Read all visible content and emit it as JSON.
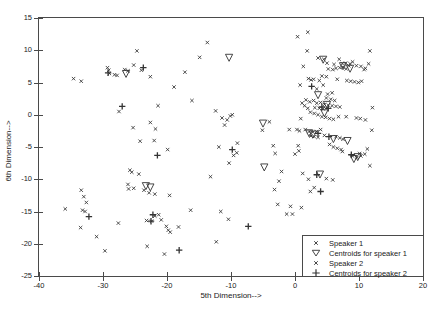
{
  "chart_data": {
    "type": "scatter",
    "title": "",
    "xlabel": "5th Dimension-->",
    "ylabel": "6th Dimension-->",
    "xlim": [
      -40,
      20
    ],
    "ylim": [
      -25,
      15
    ],
    "xticks": [
      -40,
      -30,
      -20,
      -10,
      0,
      10,
      20
    ],
    "yticks": [
      -25,
      -20,
      -15,
      -10,
      -5,
      0,
      5,
      10,
      15
    ],
    "xticklabels": [
      "-40",
      "-30",
      "-20",
      "-10",
      "0",
      "10",
      "20"
    ],
    "yticklabels": [
      "-25",
      "-20",
      "-15",
      "-10",
      "-5",
      "0",
      "5",
      "10",
      "15"
    ],
    "grid": false,
    "legend_position": "lower right",
    "marker_color": "#333333",
    "axis_color": "#4a4a4a",
    "series": [
      {
        "name": "Speaker 1",
        "marker": "x-small",
        "points": [
          [
            -34.6,
            5.6
          ],
          [
            -33.4,
            5.2
          ],
          [
            -29.3,
            7.3
          ],
          [
            -29.1,
            6.9
          ],
          [
            -29.0,
            6.4
          ],
          [
            -28.2,
            6.2
          ],
          [
            -27.8,
            6.1
          ],
          [
            -26.6,
            7.0
          ],
          [
            -26.1,
            6.8
          ],
          [
            -25.2,
            7.7
          ],
          [
            -24.7,
            9.9
          ],
          [
            -24.0,
            6.9
          ],
          [
            -22.6,
            5.9
          ],
          [
            -27.5,
            0.5
          ],
          [
            -25.3,
            -2.0
          ],
          [
            -24.2,
            -4.1
          ],
          [
            -22.6,
            -1.2
          ],
          [
            -21.4,
            1.4
          ],
          [
            -21.8,
            -2.2
          ],
          [
            -22.0,
            -4.0
          ],
          [
            -19.9,
            -5.4
          ],
          [
            -18.9,
            4.3
          ],
          [
            -17.2,
            6.6
          ],
          [
            -16.1,
            2.2
          ],
          [
            -13.7,
            11.2
          ],
          [
            -14.9,
            8.9
          ],
          [
            -12.4,
            0.6
          ],
          [
            -11.4,
            -0.5
          ],
          [
            -11.0,
            -1.6
          ],
          [
            -10.1,
            -0.2
          ],
          [
            -9.8,
            0.0
          ],
          [
            -10.6,
            -0.8
          ],
          [
            -11.9,
            -5.0
          ],
          [
            -10.3,
            -7.5
          ],
          [
            -9.0,
            -4.4
          ],
          [
            -9.6,
            -6.3
          ],
          [
            -9.1,
            -5.9
          ],
          [
            -13.2,
            -9.6
          ],
          [
            -16.3,
            -14.8
          ],
          [
            -11.6,
            -15.0
          ],
          [
            -10.4,
            -16.2
          ],
          [
            -12.3,
            -19.7
          ],
          [
            -25.8,
            -8.6
          ],
          [
            -25.5,
            -8.9
          ],
          [
            -26.1,
            -10.8
          ],
          [
            -26.0,
            -11.5
          ],
          [
            -24.4,
            -9.2
          ],
          [
            -25.2,
            -11.4
          ],
          [
            -23.6,
            -11.7
          ],
          [
            -22.8,
            -12.1
          ],
          [
            -21.9,
            -12.3
          ],
          [
            -19.6,
            -12.5
          ],
          [
            -33.4,
            -11.7
          ],
          [
            -33.0,
            -12.7
          ],
          [
            -32.6,
            -13.6
          ],
          [
            -35.9,
            -14.6
          ],
          [
            -33.2,
            -14.8
          ],
          [
            -32.8,
            -15.0
          ],
          [
            -33.5,
            -17.5
          ],
          [
            -31.0,
            -18.9
          ],
          [
            -29.7,
            -21.1
          ],
          [
            -27.6,
            -16.8
          ],
          [
            -21.9,
            -15.7
          ],
          [
            -21.3,
            -15.5
          ],
          [
            -20.9,
            -16.3
          ],
          [
            -20.1,
            -17.3
          ],
          [
            -19.8,
            -17.9
          ],
          [
            -19.5,
            -18.2
          ],
          [
            -18.2,
            -17.4
          ],
          [
            -22.4,
            -16.5
          ],
          [
            -23.1,
            -20.4
          ],
          [
            -20.4,
            -21.6
          ],
          [
            -23.2,
            -16.4
          ],
          [
            -5.1,
            -2.4
          ],
          [
            -4.0,
            -1.1
          ],
          [
            -3.4,
            -4.8
          ],
          [
            -3.1,
            -6.0
          ],
          [
            -2.1,
            -8.8
          ],
          [
            -2.5,
            -10.3
          ],
          [
            -3.2,
            -11.6
          ],
          [
            -2.7,
            -13.9
          ],
          [
            -1.3,
            -15.4
          ],
          [
            -0.7,
            -14.2
          ],
          [
            0.6,
            -5.6
          ],
          [
            1.2,
            -9.1
          ],
          [
            2.1,
            -10.0
          ],
          [
            3.0,
            -11.3
          ],
          [
            2.4,
            -11.9
          ]
        ]
      },
      {
        "name": "Speaker 2",
        "marker": "x-small",
        "points": [
          [
            0.4,
            12.1
          ],
          [
            2.0,
            12.8
          ],
          [
            1.9,
            9.9
          ],
          [
            3.6,
            8.8
          ],
          [
            4.5,
            8.6
          ],
          [
            5.0,
            8.0
          ],
          [
            6.1,
            7.8
          ],
          [
            7.4,
            7.9
          ],
          [
            7.9,
            8.0
          ],
          [
            8.6,
            7.9
          ],
          [
            9.6,
            7.6
          ],
          [
            10.3,
            7.5
          ],
          [
            11.0,
            7.2
          ],
          [
            11.5,
            7.9
          ],
          [
            11.7,
            9.9
          ],
          [
            5.2,
            7.1
          ],
          [
            5.9,
            7.0
          ],
          [
            6.4,
            7.2
          ],
          [
            7.0,
            7.3
          ],
          [
            7.5,
            7.4
          ],
          [
            8.0,
            7.1
          ],
          [
            8.4,
            7.6
          ],
          [
            4.2,
            6.0
          ],
          [
            4.9,
            5.9
          ],
          [
            6.6,
            5.5
          ],
          [
            8.1,
            5.3
          ],
          [
            8.7,
            5.2
          ],
          [
            9.3,
            5.1
          ],
          [
            9.9,
            5.0
          ],
          [
            10.4,
            5.2
          ],
          [
            1.3,
            7.5
          ],
          [
            2.1,
            5.6
          ],
          [
            2.5,
            5.4
          ],
          [
            2.9,
            5.5
          ],
          [
            0.8,
            4.6
          ],
          [
            3.4,
            4.0
          ],
          [
            5.1,
            3.2
          ],
          [
            5.8,
            3.4
          ],
          [
            1.7,
            2.3
          ],
          [
            2.3,
            2.0
          ],
          [
            2.9,
            2.2
          ],
          [
            3.4,
            1.8
          ],
          [
            4.0,
            1.9
          ],
          [
            4.6,
            1.6
          ],
          [
            5.2,
            1.5
          ],
          [
            5.8,
            1.4
          ],
          [
            6.4,
            1.3
          ],
          [
            7.0,
            1.2
          ],
          [
            3.1,
            1.1
          ],
          [
            3.8,
            1.0
          ],
          [
            4.4,
            0.9
          ],
          [
            2.0,
            1.0
          ],
          [
            2.4,
            0.4
          ],
          [
            3.0,
            0.2
          ],
          [
            3.6,
            0.0
          ],
          [
            4.2,
            -0.3
          ],
          [
            4.8,
            -0.4
          ],
          [
            5.4,
            -0.6
          ],
          [
            6.0,
            -0.7
          ],
          [
            6.8,
            -0.3
          ],
          [
            8.0,
            -0.3
          ],
          [
            9.6,
            -0.5
          ],
          [
            10.2,
            -0.6
          ],
          [
            12.1,
            1.1
          ],
          [
            0.9,
            -0.6
          ],
          [
            0.3,
            -2.3
          ],
          [
            0.7,
            -2.5
          ],
          [
            1.6,
            -2.3
          ],
          [
            2.2,
            -2.6
          ],
          [
            2.8,
            -2.7
          ],
          [
            3.4,
            -2.6
          ],
          [
            4.0,
            -2.3
          ],
          [
            2.5,
            -3.3
          ],
          [
            3.0,
            -3.4
          ],
          [
            3.6,
            -3.5
          ],
          [
            4.6,
            -3.2
          ],
          [
            5.4,
            -4.6
          ],
          [
            6.0,
            -5.0
          ],
          [
            6.6,
            -5.2
          ],
          [
            7.2,
            -5.4
          ],
          [
            9.0,
            -6.4
          ],
          [
            9.7,
            -6.6
          ],
          [
            10.3,
            -6.4
          ],
          [
            10.9,
            -6.1
          ],
          [
            11.3,
            -5.3
          ],
          [
            11.7,
            -7.9
          ],
          [
            12.0,
            -2.4
          ],
          [
            11.0,
            -0.8
          ],
          [
            0.5,
            -4.8
          ],
          [
            0.0,
            -6.1
          ],
          [
            1.0,
            -14.4
          ],
          [
            -0.4,
            -15.4
          ],
          [
            4.9,
            -9.9
          ],
          [
            5.9,
            -10.1
          ],
          [
            7.4,
            -5.7
          ],
          [
            10.1,
            -6.0
          ],
          [
            6.4,
            -3.4
          ],
          [
            7.0,
            -3.6
          ],
          [
            7.5,
            -3.8
          ],
          [
            4.9,
            2.6
          ],
          [
            5.6,
            2.4
          ],
          [
            6.2,
            2.2
          ],
          [
            4.4,
            4.6
          ],
          [
            3.8,
            5.3
          ],
          [
            1.1,
            1.8
          ],
          [
            1.5,
            1.4
          ],
          [
            -0.9,
            -2.3
          ],
          [
            10.8,
            7.0
          ],
          [
            9.0,
            8.2
          ],
          [
            6.9,
            8.6
          ]
        ]
      },
      {
        "name": "Centroids for speaker 1",
        "marker": "triangle-down",
        "points": [
          [
            -26.4,
            6.4
          ],
          [
            -10.3,
            8.9
          ],
          [
            -5.0,
            -1.3
          ],
          [
            -4.8,
            -8.1
          ],
          [
            -22.6,
            -11.2
          ],
          [
            -23.3,
            -11.0
          ]
        ]
      },
      {
        "name": "Centroids for speaker 2",
        "marker": "plus",
        "points": [
          [
            -29.2,
            6.5
          ],
          [
            -23.7,
            7.3
          ],
          [
            -27.0,
            1.3
          ],
          [
            -21.5,
            -6.3
          ],
          [
            -22.2,
            -15.5
          ],
          [
            -22.5,
            -16.5
          ],
          [
            -18.1,
            -21.0
          ],
          [
            -7.3,
            -17.3
          ],
          [
            -32.2,
            -15.8
          ],
          [
            -9.8,
            -5.4
          ],
          [
            2.6,
            4.4
          ],
          [
            4.2,
            1.2
          ],
          [
            3.6,
            -2.9
          ],
          [
            5.3,
            -3.4
          ],
          [
            4.0,
            -11.9
          ],
          [
            8.8,
            -6.2
          ],
          [
            3.4,
            -9.3
          ],
          [
            5.2,
            1.0
          ]
        ]
      },
      {
        "name": "Centroids for speaker 1 (cluster)",
        "marker": "triangle-down",
        "points": [
          [
            4.4,
            8.6
          ],
          [
            7.5,
            7.6
          ],
          [
            8.6,
            7.2
          ],
          [
            3.6,
            3.1
          ],
          [
            5.0,
            1.6
          ],
          [
            4.6,
            0.3
          ],
          [
            6.0,
            -3.7
          ],
          [
            8.2,
            -4.0
          ],
          [
            9.8,
            -6.5
          ],
          [
            9.2,
            -6.8
          ],
          [
            3.9,
            -9.2
          ],
          [
            2.2,
            -2.8
          ],
          [
            2.8,
            -3.0
          ]
        ]
      }
    ]
  },
  "legend": {
    "entries": [
      {
        "label": "Speaker 1",
        "marker": "x-small"
      },
      {
        "label": "Centroids for speaker 1",
        "marker": "triangle-down"
      },
      {
        "label": "Speaker 2",
        "marker": "x-small"
      },
      {
        "label": "Centroids for speaker 2",
        "marker": "plus"
      }
    ]
  }
}
